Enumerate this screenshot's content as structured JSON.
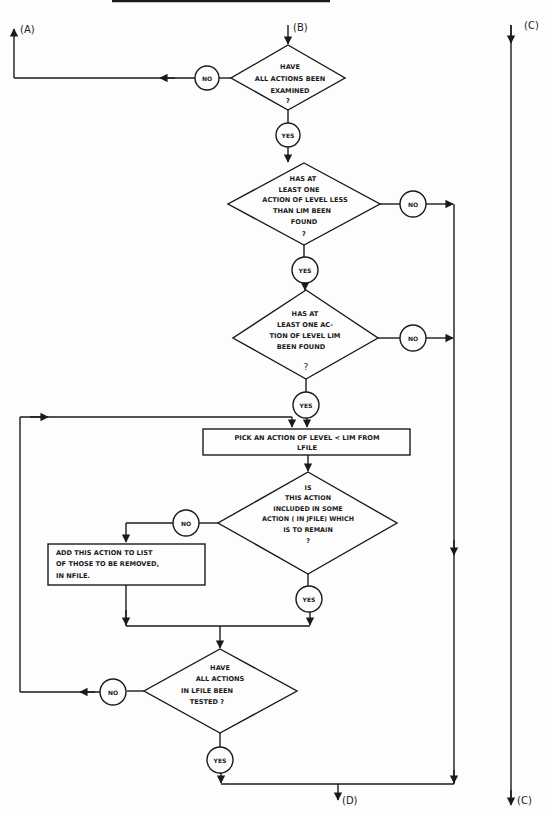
{
  "diagram": {
    "type": "flowchart",
    "connectors": {
      "A": "(A)",
      "B": "(B)",
      "C_top": "(C)",
      "C_bottom": "(C)",
      "D": "(D)"
    },
    "decisions": [
      {
        "id": "d1",
        "lines": [
          "HAVE",
          "ALL ACTIONS BEEN",
          "EXAMINED",
          "?"
        ],
        "no": "NO",
        "yes": "YES"
      },
      {
        "id": "d2",
        "lines": [
          "HAS AT",
          "LEAST ONE",
          "ACTION OF LEVEL LESS",
          "THAN LIM BEEN",
          "FOUND",
          "?"
        ],
        "no": "NO",
        "yes": "YES"
      },
      {
        "id": "d3",
        "lines": [
          "HAS AT",
          "LEAST ONE AC-",
          "TION OF LEVEL LIM",
          "BEEN FOUND",
          "?"
        ],
        "no": "NO",
        "yes": "YES"
      },
      {
        "id": "d4",
        "lines": [
          "IS",
          "THIS ACTION",
          "INCLUDED IN SOME",
          "ACTION ( IN JFILE) WHICH",
          "IS TO REMAIN",
          "?"
        ],
        "no": "NO",
        "yes": "YES"
      },
      {
        "id": "d5",
        "lines": [
          "HAVE",
          "ALL ACTIONS",
          "IN LFILE BEEN",
          "TESTED ?"
        ],
        "no": "NO",
        "yes": "YES"
      }
    ],
    "processes": [
      {
        "id": "p1",
        "lines": [
          "PICK AN ACTION OF LEVEL < LIM FROM",
          "LFILE"
        ]
      },
      {
        "id": "p2",
        "lines": [
          "ADD THIS ACTION TO LIST",
          "OF THOSE TO BE REMOVED,",
          "IN  NFILE."
        ]
      }
    ]
  }
}
